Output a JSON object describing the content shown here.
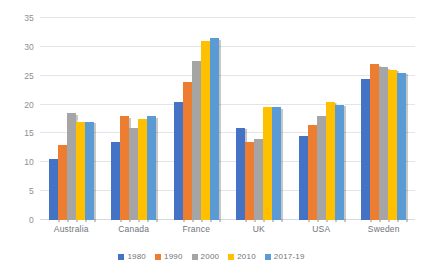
{
  "chart_data": {
    "type": "bar",
    "title": "",
    "subtitle": "",
    "xlabel": "",
    "ylabel": "",
    "ylim": [
      0,
      35
    ],
    "ytick_step": 5,
    "yticks": [
      "0",
      "5",
      "10",
      "15",
      "20",
      "25",
      "30",
      "35"
    ],
    "grid": true,
    "legend_position": "bottom",
    "categories": [
      "Australia",
      "Canada",
      "France",
      "UK",
      "USA",
      "Sweden"
    ],
    "series": [
      {
        "name": "1980",
        "color": "#4472C4",
        "values": [
          10.5,
          13.5,
          20.5,
          16.0,
          14.5,
          24.5
        ]
      },
      {
        "name": "1990",
        "color": "#ED7D31",
        "values": [
          13.0,
          18.0,
          24.0,
          13.5,
          16.5,
          27.0
        ]
      },
      {
        "name": "2000",
        "color": "#A5A5A5",
        "values": [
          18.5,
          16.0,
          27.5,
          14.0,
          18.0,
          26.5
        ]
      },
      {
        "name": "2010",
        "color": "#FFC000",
        "values": [
          17.0,
          17.5,
          31.0,
          19.5,
          20.5,
          26.0
        ]
      },
      {
        "name": "2017-19",
        "color": "#5B9BD5",
        "values": [
          17.0,
          18.0,
          31.5,
          19.5,
          20.0,
          25.5
        ]
      }
    ]
  },
  "colors": {
    "background": "#FFFFFF",
    "gridline": "#E2E6EA",
    "axis_text": "#8A8F96",
    "category_text": "#6F747B",
    "legend_text": "#6F747B"
  }
}
